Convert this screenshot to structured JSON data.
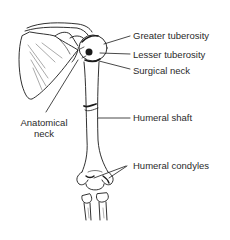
{
  "diagram": {
    "labels": {
      "greater_tuberosity": "Greater tuberosity",
      "lesser_tuberosity": "Lesser tuberosity",
      "surgical_neck": "Surgical neck",
      "humeral_shaft": "Humeral shaft",
      "humeral_condyles": "Humeral condyles",
      "anatomical_neck_line1": "Anatomical",
      "anatomical_neck_line2": "neck"
    },
    "colors": {
      "line": "#1a1a1a",
      "text": "#2a2a2a",
      "background": "#ffffff"
    }
  }
}
